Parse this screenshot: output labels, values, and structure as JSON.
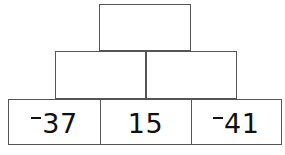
{
  "figure": {
    "kind": "number-pyramid",
    "rows": [
      {
        "name": "top-row",
        "cells": [
          {
            "label": "",
            "negative": false,
            "empty": true
          }
        ]
      },
      {
        "name": "middle-row",
        "cells": [
          {
            "label": "",
            "negative": false,
            "empty": true
          },
          {
            "label": "",
            "negative": false,
            "empty": true
          }
        ]
      },
      {
        "name": "bottom-row",
        "cells": [
          {
            "label": "37",
            "negative": true,
            "empty": false
          },
          {
            "label": "15",
            "negative": false,
            "empty": false
          },
          {
            "label": "41",
            "negative": true,
            "empty": false
          }
        ]
      }
    ]
  },
  "colors": {
    "border": "#555555",
    "fill": "#ffffff",
    "text": "#111111",
    "background": "#ffffff"
  }
}
